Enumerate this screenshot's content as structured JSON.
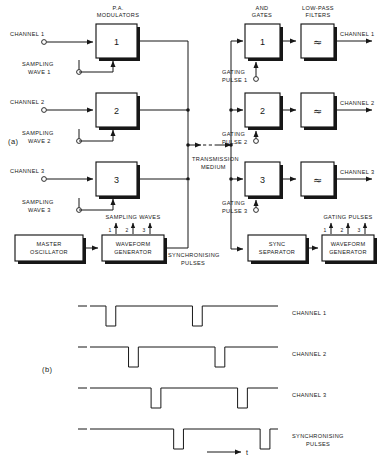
{
  "figure": {
    "part_a_label": "(a)",
    "part_b_label": "(b)",
    "time_axis_label": "t"
  },
  "diagram": {
    "group_headings": {
      "pa_modulators": "P.A.\nMODULATORS",
      "pa_modulators_line1": "P.A.",
      "pa_modulators_line2": "MODULATORS",
      "and_gates_line1": "AND",
      "and_gates_line2": "GATES",
      "low_pass_line1": "LOW-PASS",
      "low_pass_line2": "FILTERS",
      "sampling_waves": "SAMPLING WAVES",
      "gating_pulses": "GATING PULSES"
    },
    "transmit_inputs": [
      {
        "label": "CHANNEL 1"
      },
      {
        "label": "CHANNEL 2"
      },
      {
        "label": "CHANNEL 3"
      }
    ],
    "modulators": [
      {
        "number": "1"
      },
      {
        "number": "2"
      },
      {
        "number": "3"
      }
    ],
    "sampling_wave_inputs": [
      {
        "line1": "SAMPLING",
        "line2": "WAVE 1"
      },
      {
        "line1": "SAMPLING",
        "line2": "WAVE 2"
      },
      {
        "line1": "SAMPLING",
        "line2": "WAVE 3"
      }
    ],
    "transmission_medium": {
      "line1": "TRANSMISSION",
      "line2": "MEDIUM"
    },
    "and_gates": [
      {
        "number": "1"
      },
      {
        "number": "2"
      },
      {
        "number": "3"
      }
    ],
    "gating_pulse_inputs": [
      {
        "line1": "GATING",
        "line2": "PULSE 1"
      },
      {
        "line1": "GATING",
        "line2": "PULSE 2"
      },
      {
        "line1": "GATING",
        "line2": "PULSE 3"
      }
    ],
    "low_pass_filters": [
      {
        "symbol": "≈"
      },
      {
        "symbol": "≈"
      },
      {
        "symbol": "≈"
      }
    ],
    "receive_outputs": [
      {
        "label": "CHANNEL 1"
      },
      {
        "label": "CHANNEL 2"
      },
      {
        "label": "CHANNEL 3"
      }
    ],
    "master_oscillator": {
      "line1": "MASTER",
      "line2": "OSCILLATOR"
    },
    "waveform_generator_tx": {
      "line1": "WAVEFORM",
      "line2": "GENERATOR"
    },
    "sync_separator": {
      "line1": "SYNC",
      "line2": "SEPARATOR"
    },
    "waveform_generator_rx": {
      "line1": "WAVEFORM",
      "line2": "GENERATOR"
    },
    "synchronising_pulses": {
      "line1": "SYNCHRONISING",
      "line2": "PULSES"
    },
    "sampling_wave_numbers": [
      "1",
      "2",
      "3"
    ],
    "gating_pulse_numbers": [
      "1",
      "2",
      "3"
    ]
  },
  "timing": {
    "traces": [
      {
        "name": "channel-1",
        "label_line1": "CHANNEL 1",
        "label_line2": "",
        "pulse_starts": [
          0.085,
          0.545
        ],
        "pulse_width": 0.052
      },
      {
        "name": "channel-2",
        "label_line1": "CHANNEL 2",
        "label_line2": "",
        "pulse_starts": [
          0.205,
          0.665
        ],
        "pulse_width": 0.052
      },
      {
        "name": "channel-3",
        "label_line1": "CHANNEL 3",
        "label_line2": "",
        "pulse_starts": [
          0.325,
          0.785
        ],
        "pulse_width": 0.052
      },
      {
        "name": "synchronising-pulses",
        "label_line1": "SYNCHRONISING",
        "label_line2": "PULSES",
        "pulse_starts": [
          0.445,
          0.905
        ],
        "pulse_width": 0.052
      }
    ]
  },
  "chart_data": {
    "type": "line",
    "xlabel": "t",
    "ylabel": "",
    "series": [
      {
        "name": "CHANNEL 1",
        "pulse_times": [
          0.085,
          0.545
        ],
        "level_high": 1,
        "level_low": 0
      },
      {
        "name": "CHANNEL 2",
        "pulse_times": [
          0.205,
          0.665
        ],
        "level_high": 1,
        "level_low": 0
      },
      {
        "name": "CHANNEL 3",
        "pulse_times": [
          0.325,
          0.785
        ],
        "level_high": 1,
        "level_low": 0
      },
      {
        "name": "SYNCHRONISING PULSES",
        "pulse_times": [
          0.445,
          0.905
        ],
        "level_high": 1,
        "level_low": 0
      }
    ],
    "grid": false,
    "legend": "right"
  },
  "colors": {
    "ink": "#171717",
    "paper": "#ffffff"
  }
}
